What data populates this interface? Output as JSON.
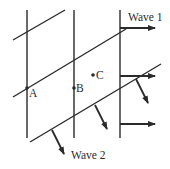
{
  "diagram": {
    "labels": {
      "wave1": "Wave 1",
      "wave2": "Wave 2",
      "point_a": "A",
      "point_b": "B",
      "point_c": "C"
    },
    "wave1_wavefronts": [
      {
        "x": 27,
        "y1": 10,
        "y2": 138
      },
      {
        "x": 74,
        "y1": 10,
        "y2": 138
      },
      {
        "x": 120,
        "y1": 10,
        "y2": 138
      }
    ],
    "wave2_wavefronts": [
      {
        "x1": 13,
        "y1": 40,
        "x2": 65,
        "y2": 10
      },
      {
        "x1": 13,
        "y1": 97,
        "x2": 126,
        "y2": 29
      },
      {
        "x1": 30,
        "y1": 142,
        "x2": 161,
        "y2": 64
      }
    ],
    "wave1_arrows": [
      {
        "x1": 120,
        "y1": 28,
        "x2": 155,
        "y2": 28
      },
      {
        "x1": 120,
        "y1": 76,
        "x2": 155,
        "y2": 76
      },
      {
        "x1": 120,
        "y1": 124,
        "x2": 155,
        "y2": 124
      }
    ],
    "wave2_arrows": [
      {
        "x1": 52,
        "y1": 130,
        "x2": 64,
        "y2": 154
      },
      {
        "x1": 95,
        "y1": 105,
        "x2": 107,
        "y2": 129
      },
      {
        "x1": 136,
        "y1": 79,
        "x2": 148,
        "y2": 103
      }
    ],
    "points": [
      {
        "name": "A",
        "x": 27,
        "y": 88
      },
      {
        "name": "B",
        "x": 74,
        "y": 88
      },
      {
        "name": "C",
        "x": 93,
        "y": 75
      }
    ],
    "colors": {
      "ink": "#2a2a2a",
      "background": "#ffffff"
    }
  }
}
